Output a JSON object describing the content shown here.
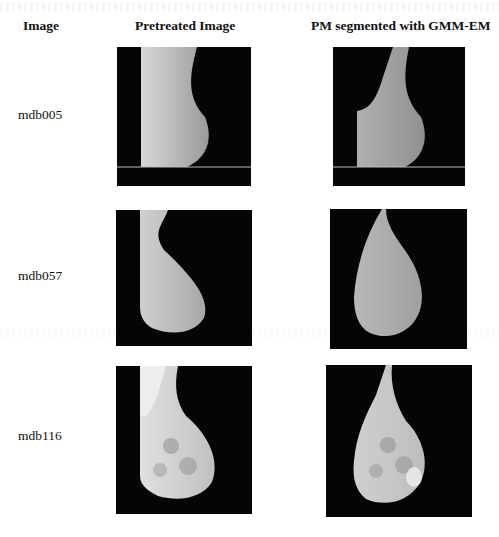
{
  "headers": {
    "image": "Image",
    "pretreated": "Pretreated Image",
    "segmented": "PM segmented with GMM-EM"
  },
  "rows": [
    {
      "label": "mdb005",
      "pretreated_alt": "mdb005 pretreated mammogram",
      "segmented_alt": "mdb005 pectoral muscle segmented"
    },
    {
      "label": "mdb057",
      "pretreated_alt": "mdb057 pretreated mammogram",
      "segmented_alt": "mdb057 pectoral muscle segmented"
    },
    {
      "label": "mdb116",
      "pretreated_alt": "mdb116 pretreated mammogram",
      "segmented_alt": "mdb116 pectoral muscle segmented"
    }
  ]
}
